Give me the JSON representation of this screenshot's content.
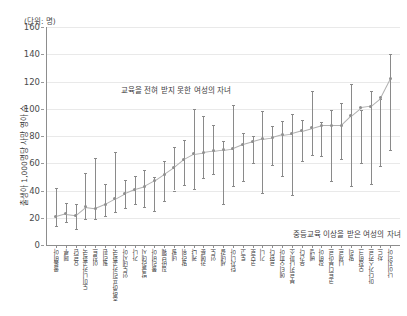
{
  "unit_caption": "(단위: 명)",
  "y_axis_title": "출생아 1,000명당 사망 영아 수",
  "annotations": {
    "upper": "교육을 전혀 받지 못한 여성의 자녀",
    "lower": "중등교육 이상을 받은 여성의 자녀"
  },
  "chart_data": {
    "type": "line",
    "title": "",
    "subtitle": "",
    "xlabel": "",
    "ylabel": "출생아 1,000명당 사망 영아 수",
    "unit": "(단위: 명)",
    "ylim": [
      0,
      160
    ],
    "yticks": [
      0,
      20,
      40,
      60,
      80,
      100,
      120,
      140,
      160
    ],
    "grid": true,
    "legend_position": "in-plot-annotation",
    "legend": [
      "교육을 전혀 받지 못한 여성의 자녀",
      "중등교육 이상을 받은 여성의 자녀"
    ],
    "categories": [
      "콜롬비아",
      "페루",
      "요르단",
      "도미니카공화국",
      "이집트",
      "필리핀",
      "중앙아프리카공화국",
      "인도네시아",
      "가나",
      "방글라데시",
      "볼리비아",
      "짐바브웨",
      "네팔",
      "말라위",
      "케냐",
      "카메룬",
      "인도",
      "세네갈",
      "탄자니아",
      "토고",
      "코모로",
      "기니",
      "르완다",
      "에티오피아",
      "부르키나파소",
      "우간다",
      "베냉",
      "잠비아",
      "코트디부아르",
      "니제르",
      "말리",
      "모잠비크",
      "마다가스카르",
      "차드",
      "나이지리아"
    ],
    "series": [
      {
        "name": "평균 영아사망률",
        "values": [
          21,
          23,
          22,
          28,
          27,
          30,
          34,
          38,
          41,
          43,
          47,
          52,
          57,
          63,
          67,
          68,
          69,
          70,
          71,
          74,
          76,
          78,
          79,
          81,
          82,
          84,
          86,
          88,
          88,
          88,
          95,
          101,
          102,
          108,
          122
        ]
      },
      {
        "name": "하한 (중등교육 이상을 받은 여성의 자녀)",
        "values": [
          14,
          17,
          12,
          19,
          19,
          21,
          24,
          27,
          30,
          28,
          25,
          32,
          40,
          44,
          41,
          49,
          52,
          30,
          43,
          47,
          60,
          38,
          59,
          51,
          37,
          62,
          66,
          65,
          47,
          63,
          43,
          60,
          45,
          58,
          70
        ]
      },
      {
        "name": "상한 (교육을 전혀 받지 못한 여성의 자녀)",
        "values": [
          42,
          31,
          30,
          53,
          64,
          45,
          68,
          48,
          51,
          55,
          50,
          62,
          72,
          77,
          100,
          95,
          88,
          76,
          103,
          82,
          80,
          98,
          87,
          91,
          96,
          92,
          113,
          90,
          99,
          104,
          118,
          99,
          113,
          107,
          140
        ]
      }
    ]
  }
}
